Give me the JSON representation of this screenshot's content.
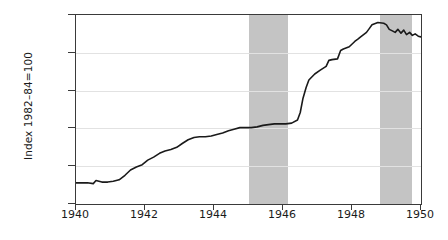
{
  "chart_data": {
    "type": "line",
    "title": "",
    "subtitle": "",
    "xlabel": "",
    "ylabel": "Index 1982–84=100",
    "xlim": [
      1940,
      1950
    ],
    "ylim": [
      12.5,
      25.0
    ],
    "grid": true,
    "legend_position": "none",
    "x_ticks": [
      "1940",
      "1942",
      "1944",
      "1946",
      "1948",
      "1950"
    ],
    "y_ticks": [
      "12.5",
      "15.0",
      "17.5",
      "20.0",
      "22.5",
      "25.0"
    ],
    "line_color": "#1a1a1a",
    "band_color": "#c4c4c4",
    "grid_color": "#e2e2e2",
    "axis_color": "#3a3a3a",
    "shaded_regions": [
      {
        "label": "recession-band-1",
        "start": 1945.0,
        "end": 1946.15
      },
      {
        "label": "recession-band-2",
        "start": 1948.8,
        "end": 1949.75
      }
    ],
    "series": [
      {
        "name": "Consumer Price Index",
        "x": [
          1940.0,
          1940.17,
          1940.33,
          1940.5,
          1940.58,
          1940.75,
          1940.92,
          1941.08,
          1941.25,
          1941.42,
          1941.58,
          1941.75,
          1941.92,
          1942.08,
          1942.25,
          1942.42,
          1942.58,
          1942.75,
          1942.92,
          1943.08,
          1943.25,
          1943.42,
          1943.58,
          1943.75,
          1943.92,
          1944.08,
          1944.25,
          1944.42,
          1944.58,
          1944.75,
          1944.92,
          1945.08,
          1945.25,
          1945.42,
          1945.58,
          1945.75,
          1945.92,
          1946.08,
          1946.25,
          1946.42,
          1946.5,
          1946.58,
          1946.67,
          1946.75,
          1946.92,
          1947.08,
          1947.25,
          1947.33,
          1947.42,
          1947.58,
          1947.67,
          1947.75,
          1947.92,
          1948.08,
          1948.17,
          1948.25,
          1948.42,
          1948.5,
          1948.58,
          1948.75,
          1948.92,
          1949.0,
          1949.08,
          1949.17,
          1949.25,
          1949.33,
          1949.42,
          1949.5,
          1949.58,
          1949.67,
          1949.75,
          1949.83,
          1949.92,
          1950.0
        ],
        "values": [
          13.9,
          13.9,
          13.9,
          13.85,
          14.05,
          13.95,
          13.95,
          14.0,
          14.1,
          14.4,
          14.75,
          14.95,
          15.1,
          15.4,
          15.6,
          15.85,
          16.0,
          16.1,
          16.25,
          16.5,
          16.75,
          16.9,
          16.95,
          16.95,
          17.0,
          17.1,
          17.2,
          17.35,
          17.45,
          17.55,
          17.55,
          17.55,
          17.6,
          17.7,
          17.75,
          17.8,
          17.8,
          17.8,
          17.85,
          18.05,
          18.55,
          19.5,
          20.2,
          20.7,
          21.1,
          21.35,
          21.6,
          22.0,
          22.05,
          22.1,
          22.65,
          22.75,
          22.9,
          23.25,
          23.4,
          23.55,
          23.85,
          24.1,
          24.35,
          24.5,
          24.45,
          24.35,
          24.05,
          23.95,
          23.85,
          24.05,
          23.8,
          24.0,
          23.7,
          23.85,
          23.65,
          23.75,
          23.6,
          23.55
        ]
      }
    ]
  },
  "axis": {
    "y_title": "Index 1982–84=100"
  }
}
